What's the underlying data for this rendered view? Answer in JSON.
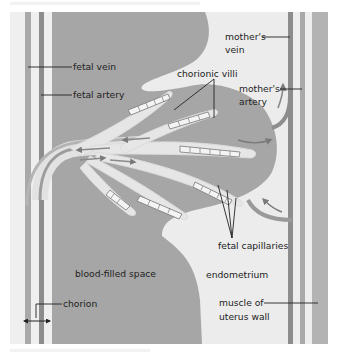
{
  "colors": {
    "blood": "#a6a6a6",
    "tissue": "#ececec",
    "vessel": "#8f8f8f",
    "vessel_light": "#bdbdbd",
    "villus": "#e6e6e6",
    "line": "#222222",
    "background": "#ffffff"
  },
  "labels": {
    "fetal_vein": "fetal vein",
    "fetal_artery": "fetal artery",
    "chorionic_villi": "chorionic villi",
    "mothers_vein_1": "mother's",
    "mothers_vein_2": "vein",
    "mothers_artery_1": "mother's",
    "mothers_artery_2": "artery",
    "fetal_capillaries": "fetal capillaries",
    "blood_filled_space": "blood-filled space",
    "endometrium": "endometrium",
    "muscle_1": "muscle of",
    "muscle_2": "uterus wall",
    "chorion": "chorion"
  }
}
